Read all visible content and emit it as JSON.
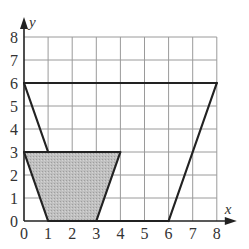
{
  "figure": {
    "axes": {
      "x_label": "x",
      "y_label": "y",
      "x_ticks": [
        "0",
        "1",
        "2",
        "3",
        "4",
        "5",
        "6",
        "7",
        "8"
      ],
      "y_ticks": [
        "0",
        "1",
        "2",
        "3",
        "4",
        "5",
        "6",
        "7",
        "8"
      ],
      "x_range": [
        0,
        8
      ],
      "y_range": [
        0,
        8
      ],
      "grid": true
    },
    "shapes": [
      {
        "name": "large-trapezoid",
        "vertices": [
          [
            0,
            6
          ],
          [
            8,
            6
          ],
          [
            6,
            0
          ],
          [
            0,
            6
          ]
        ],
        "description": "Outline: top edge y=6 from x=0 to x=8; left edge from (0,6) down toward (1,3); right edge from (8,6) to (6,0)",
        "fill": "none",
        "stroke": "#222222"
      },
      {
        "name": "shaded-trapezoid",
        "vertices": [
          [
            0,
            3
          ],
          [
            4,
            3
          ],
          [
            3,
            0
          ],
          [
            1,
            0
          ]
        ],
        "fill": "#b8b8b8",
        "stroke": "#222222"
      }
    ],
    "colors": {
      "grid": "#9a9a9a",
      "axis": "#222222",
      "shape_stroke": "#222222",
      "shade": "#b8b8b8"
    }
  }
}
